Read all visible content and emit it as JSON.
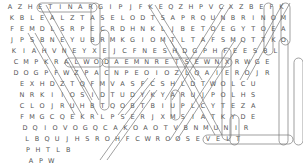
{
  "puzzle": {
    "type": "word-search",
    "cell_width": 10.05,
    "row_height": 11,
    "rows": [
      {
        "offset": 5,
        "letters": "AZHETINARGIPJFKEQZHPVCXZBEFK"
      },
      {
        "offset": 7,
        "letters": "KBLEALZTASELODTSAPRQUNBRINOM"
      },
      {
        "offset": 7,
        "letters": "FEMDLSRPECRDHNKLJBETOEGYTOEA"
      },
      {
        "offset": 7,
        "letters": "JPSBNEYUBRMKGIOMTLTAFSMQTTKO"
      },
      {
        "offset": 9,
        "letters": "KIAHVNEYXEJCFNESHDGPHFEESBL"
      },
      {
        "offset": 11,
        "letters": "CMPKRALWODAEMNRETSEWNXRWGE"
      },
      {
        "offset": 11,
        "letters": "DOGPFWZPACNPEOIOZLQAIEROJR"
      },
      {
        "offset": 17,
        "letters": "EXHDZTQFMVASFCSHLDTWOLCU"
      },
      {
        "offset": 17,
        "letters": "NRKIIOSIDTUDYKYARUJPOLHS"
      },
      {
        "offset": 17,
        "letters": "CLOJRUHBTQOBTBIUPLCYTEZA"
      },
      {
        "offset": 17,
        "letters": "FMGCQEKRLPSERJXMSIATKYDE"
      },
      {
        "offset": 20,
        "letters": "DQIOVOGQCAKOAOTVBNMUNIR"
      },
      {
        "offset": 22,
        "letters": "LBQUJHSROHFCWROOSEVELT"
      },
      {
        "offset": 23,
        "letters": "PHTLB"
      },
      {
        "offset": 26,
        "letters": "APW"
      }
    ],
    "highlight_color": "#777777",
    "text_color": "#555555"
  }
}
